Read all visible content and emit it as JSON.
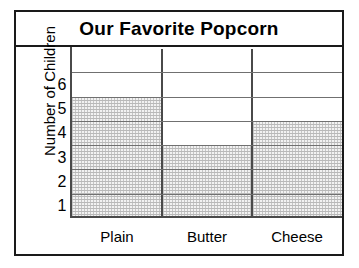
{
  "chart_data": {
    "type": "bar",
    "title": "Our Favorite Popcorn",
    "xlabel": "",
    "ylabel": "Number of Children",
    "categories": [
      "Plain",
      "Butter",
      "Cheese"
    ],
    "values": [
      5,
      3,
      4
    ],
    "ylim": [
      0,
      7
    ],
    "ytick_labels": [
      "6",
      "5",
      "4",
      "3",
      "2",
      "1"
    ],
    "ytick_values": [
      6,
      5,
      4,
      3,
      2,
      1
    ],
    "grid": true,
    "legend": "none",
    "orientation": "vertical",
    "bar_fill": "dotted-pattern",
    "colors": {
      "frame": "#1a1a1a",
      "gridline": "#707070",
      "axis": "#4a4a4a",
      "bar_fill": "#f2f2f2",
      "background": "#ffffff",
      "text": "#000000"
    },
    "rows": [
      {
        "label": "",
        "index": 7
      },
      {
        "label": "6",
        "index": 6
      },
      {
        "label": "5",
        "index": 5
      },
      {
        "label": "4",
        "index": 4
      },
      {
        "label": "3",
        "index": 3
      },
      {
        "label": "2",
        "index": 2
      },
      {
        "label": "1",
        "index": 1
      }
    ],
    "bars": [
      {
        "category": "Plain",
        "value": 5,
        "fraction": "5/7"
      },
      {
        "category": "Butter",
        "value": 3,
        "fraction": "3/7"
      },
      {
        "category": "Cheese",
        "value": 4,
        "fraction": "4/7"
      }
    ]
  }
}
